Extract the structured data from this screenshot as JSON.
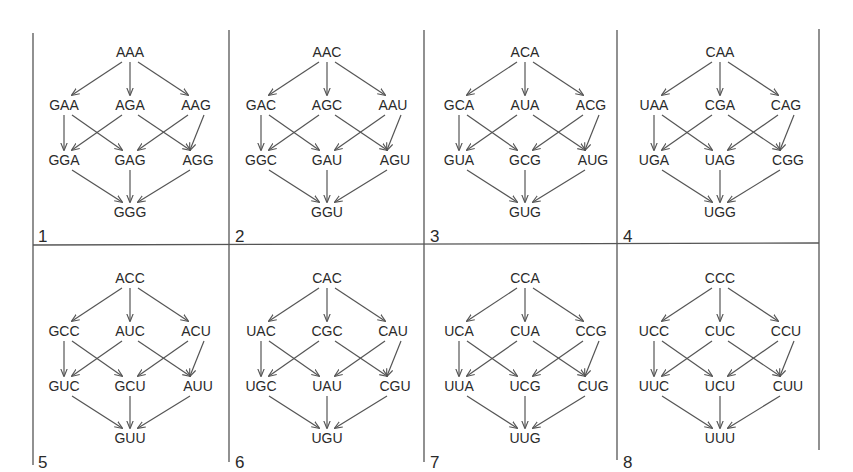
{
  "figure": {
    "colors": {
      "line": "#555555",
      "text": "#2a2a2a",
      "background": "#ffffff"
    }
  },
  "panels": [
    {
      "number": "1",
      "top": "AAA",
      "mid": [
        "GAA",
        "AGA",
        "AAG"
      ],
      "low": [
        "GGA",
        "GAG",
        "AGG"
      ],
      "bottom": "GGG"
    },
    {
      "number": "2",
      "top": "AAC",
      "mid": [
        "GAC",
        "AGC",
        "AAU"
      ],
      "low": [
        "GGC",
        "GAU",
        "AGU"
      ],
      "bottom": "GGU"
    },
    {
      "number": "3",
      "top": "ACA",
      "mid": [
        "GCA",
        "AUA",
        "ACG"
      ],
      "low": [
        "GUA",
        "GCG",
        "AUG"
      ],
      "bottom": "GUG"
    },
    {
      "number": "4",
      "top": "CAA",
      "mid": [
        "UAA",
        "CGA",
        "CAG"
      ],
      "low": [
        "UGA",
        "UAG",
        "CGG"
      ],
      "bottom": "UGG"
    },
    {
      "number": "5",
      "top": "ACC",
      "mid": [
        "GCC",
        "AUC",
        "ACU"
      ],
      "low": [
        "GUC",
        "GCU",
        "AUU"
      ],
      "bottom": "GUU"
    },
    {
      "number": "6",
      "top": "CAC",
      "mid": [
        "UAC",
        "CGC",
        "CAU"
      ],
      "low": [
        "UGC",
        "UAU",
        "CGU"
      ],
      "bottom": "UGU"
    },
    {
      "number": "7",
      "top": "CCA",
      "mid": [
        "UCA",
        "CUA",
        "CCG"
      ],
      "low": [
        "UUA",
        "UCG",
        "CUG"
      ],
      "bottom": "UUG"
    },
    {
      "number": "8",
      "top": "CCC",
      "mid": [
        "UCC",
        "CUC",
        "CCU"
      ],
      "low": [
        "UUC",
        "UCU",
        "CUU"
      ],
      "bottom": "UUU"
    }
  ],
  "edges": [
    [
      "top",
      "mid.0"
    ],
    [
      "top",
      "mid.1"
    ],
    [
      "top",
      "mid.2"
    ],
    [
      "mid.0",
      "low.0"
    ],
    [
      "mid.0",
      "low.1"
    ],
    [
      "mid.1",
      "low.0"
    ],
    [
      "mid.1",
      "low.2"
    ],
    [
      "mid.2",
      "low.1"
    ],
    [
      "mid.2",
      "low.2"
    ],
    [
      "low.0",
      "bottom"
    ],
    [
      "low.1",
      "bottom"
    ],
    [
      "low.2",
      "bottom"
    ]
  ]
}
